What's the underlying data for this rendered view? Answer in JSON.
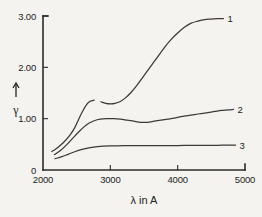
{
  "chart_data": {
    "type": "line",
    "title": "",
    "subtitle": "",
    "xlabel": "λ  in  A",
    "ylabel": "γ",
    "ylabel_arrow": "↑",
    "xlim": [
      2000,
      5000
    ],
    "ylim": [
      0,
      3.0
    ],
    "xticks": [
      2000,
      3000,
      4000,
      5000
    ],
    "xticklabels": [
      "2000",
      "3000",
      "4000",
      "5000"
    ],
    "yticks": [
      0,
      1.0,
      2.0,
      3.0
    ],
    "yticklabels": [
      "0",
      "1.00",
      "2.00",
      "3.00"
    ],
    "grid": false,
    "legend_position": "inline-right-end-labels",
    "series": [
      {
        "name": "1",
        "label": "1",
        "label_value": "1",
        "x": [
          2130,
          2200,
          2300,
          2400,
          2470,
          2530,
          2590,
          2650,
          2700,
          2760,
          2800,
          2860,
          2930,
          3000,
          3070,
          3140,
          3220,
          3300,
          3400,
          3500,
          3600,
          3700,
          3800,
          3900,
          4000,
          4100,
          4200,
          4300,
          4400,
          4500,
          4600,
          4680
        ],
        "y": [
          0.36,
          0.42,
          0.53,
          0.68,
          0.82,
          0.99,
          1.15,
          1.28,
          1.34,
          1.36,
          1.36,
          1.33,
          1.3,
          1.29,
          1.3,
          1.33,
          1.4,
          1.5,
          1.66,
          1.84,
          2.02,
          2.2,
          2.38,
          2.54,
          2.67,
          2.78,
          2.86,
          2.9,
          2.93,
          2.94,
          2.95,
          2.95
        ],
        "gap_x": [
          2790,
          2830
        ]
      },
      {
        "name": "2",
        "label": "2",
        "label_value": "2",
        "x": [
          2170,
          2250,
          2350,
          2450,
          2530,
          2600,
          2680,
          2760,
          2850,
          2950,
          3050,
          3150,
          3250,
          3350,
          3450,
          3550,
          3650,
          3750,
          3850,
          3950,
          4050,
          4150,
          4250,
          4350,
          4450,
          4550,
          4650,
          4750,
          4830
        ],
        "y": [
          0.3,
          0.37,
          0.49,
          0.63,
          0.74,
          0.83,
          0.91,
          0.96,
          0.99,
          1.0,
          1.0,
          0.99,
          0.97,
          0.95,
          0.93,
          0.93,
          0.95,
          0.97,
          0.99,
          1.01,
          1.04,
          1.06,
          1.08,
          1.1,
          1.12,
          1.14,
          1.16,
          1.17,
          1.18
        ]
      },
      {
        "name": "3",
        "label": "3",
        "label_value": "3",
        "x": [
          2180,
          2280,
          2380,
          2480,
          2580,
          2680,
          2780,
          2900,
          3050,
          3200,
          3400,
          3600,
          3800,
          4000,
          4200,
          4400,
          4600,
          4780,
          4860
        ],
        "y": [
          0.22,
          0.26,
          0.31,
          0.36,
          0.4,
          0.43,
          0.45,
          0.465,
          0.47,
          0.475,
          0.475,
          0.475,
          0.475,
          0.477,
          0.478,
          0.48,
          0.482,
          0.483,
          0.483
        ]
      }
    ]
  },
  "axes": {
    "x_title": "λ  in  A",
    "y_title": "γ",
    "y_arrow_glyph": "up-arrow"
  },
  "colors": {
    "background": "#f4f3ef",
    "ink": "#2b2b2b",
    "curve": "#3a3a3a"
  }
}
